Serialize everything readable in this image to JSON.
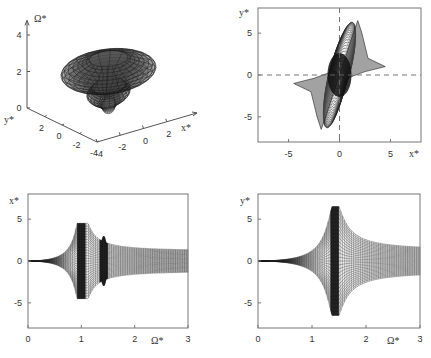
{
  "chart_data": [
    {
      "id": "panel-3d",
      "type": "surface3d",
      "title": "",
      "axes": {
        "x": {
          "label": "x*",
          "ticks": [
            -4,
            -2,
            0,
            2
          ],
          "tick_labels": [
            "-4",
            "-2",
            "0",
            "2"
          ],
          "range": [
            -4,
            4
          ]
        },
        "y": {
          "label": "y*",
          "ticks": [
            -4,
            -2,
            0,
            2
          ],
          "tick_labels": [
            "-4",
            "-2",
            "0",
            "2"
          ],
          "range": [
            -4,
            4
          ]
        },
        "z": {
          "label": "Ω*",
          "ticks": [
            0,
            2,
            4
          ],
          "tick_labels": [
            "0",
            "2",
            "4"
          ],
          "range": [
            0,
            4
          ]
        }
      },
      "description": "Hat-shaped mesh surface of response amplitude over Ω*"
    },
    {
      "id": "panel-xy",
      "type": "surface-projection",
      "xlabel": "x*",
      "ylabel": "y*",
      "xlim": [
        -8,
        8
      ],
      "ylim": [
        -8,
        8
      ],
      "xticks": [
        -5,
        0,
        5
      ],
      "yticks": [
        -5,
        0,
        5
      ],
      "xtick_labels": [
        "-5",
        "0",
        "5"
      ],
      "ytick_labels": [
        "-5",
        "0",
        "5"
      ],
      "reference_lines": {
        "x": 0,
        "y": 0,
        "style": "dashed"
      },
      "envelope_extremes": {
        "x_max": 4.5,
        "y_max": 6.5
      }
    },
    {
      "id": "panel-x-omega",
      "type": "envelope",
      "xlabel": "Ω*",
      "ylabel": "x*",
      "xlim": [
        0,
        3
      ],
      "ylim": [
        -8,
        8
      ],
      "xticks": [
        0,
        1,
        2,
        3
      ],
      "yticks": [
        -5,
        0,
        5
      ],
      "xtick_labels": [
        "0",
        "1",
        "2",
        "3"
      ],
      "ytick_labels": [
        "-5",
        "0",
        "5"
      ],
      "peak": {
        "omega": 1.0,
        "amplitude": 4.5
      },
      "secondary_band": {
        "omega": 1.42,
        "amplitude": 1.9
      },
      "asymptote": 1.2
    },
    {
      "id": "panel-y-omega",
      "type": "envelope",
      "xlabel": "Ω*",
      "ylabel": "y*",
      "xlim": [
        0,
        3
      ],
      "ylim": [
        -8,
        8
      ],
      "xticks": [
        0,
        1,
        2,
        3
      ],
      "yticks": [
        -5,
        0,
        5
      ],
      "xtick_labels": [
        "0",
        "1",
        "2",
        "3"
      ],
      "ytick_labels": [
        "-5",
        "0",
        "5"
      ],
      "peak": {
        "omega": 1.42,
        "amplitude": 6.5
      },
      "asymptote": 1.3
    }
  ],
  "labels": {
    "p1_z": "Ω*",
    "p1_y": "y*",
    "p1_x": "x*",
    "p2_x": "x*",
    "p2_y": "y*",
    "p3_x": "Ω*",
    "p3_y": "x*",
    "p4_x": "Ω*",
    "p4_y": "y*"
  }
}
